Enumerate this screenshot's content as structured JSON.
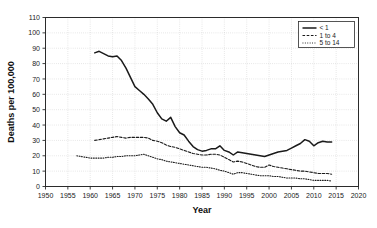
{
  "chart_data": {
    "type": "line",
    "title": "",
    "xlabel": "Year",
    "ylabel": "Deaths per 100,000",
    "xlim": [
      1950,
      2020
    ],
    "ylim": [
      0,
      110
    ],
    "xticks": [
      1950,
      1955,
      1960,
      1965,
      1970,
      1975,
      1980,
      1985,
      1990,
      1995,
      2000,
      2005,
      2010,
      2015,
      2020
    ],
    "yticks": [
      0,
      10,
      20,
      30,
      40,
      50,
      60,
      70,
      80,
      90,
      100,
      110
    ],
    "grid": true,
    "legend_position": "top-right",
    "series": [
      {
        "name": "< 1",
        "style": "solid",
        "color": "#1a1a1a",
        "x": [
          1961,
          1962,
          1963,
          1964,
          1965,
          1966,
          1967,
          1968,
          1969,
          1970,
          1971,
          1972,
          1973,
          1974,
          1975,
          1976,
          1977,
          1978,
          1979,
          1980,
          1981,
          1982,
          1983,
          1984,
          1985,
          1986,
          1987,
          1988,
          1989,
          1990,
          1991,
          1992,
          1993,
          1994,
          1995,
          1996,
          1997,
          1998,
          1999,
          2000,
          2001,
          2002,
          2003,
          2004,
          2005,
          2006,
          2007,
          2008,
          2009,
          2010,
          2011,
          2012,
          2013,
          2014
        ],
        "values": [
          87.0,
          88.0,
          86.5,
          85.0,
          84.5,
          85.0,
          82.0,
          77.0,
          71.0,
          65.0,
          62.5,
          60.0,
          57.0,
          53.5,
          48.0,
          44.0,
          42.5,
          45.0,
          39.0,
          35.0,
          33.5,
          29.5,
          26.0,
          24.0,
          23.0,
          23.5,
          24.5,
          24.5,
          26.5,
          23.5,
          22.5,
          20.5,
          22.5,
          22.0,
          21.5,
          21.0,
          20.5,
          20.0,
          19.5,
          20.5,
          21.5,
          22.5,
          23.0,
          23.5,
          25.0,
          26.5,
          28.0,
          30.5,
          29.5,
          26.5,
          28.5,
          29.5,
          29.0,
          29.0
        ]
      },
      {
        "name": "1 to 4",
        "style": "dashed",
        "color": "#1a1a1a",
        "x": [
          1961,
          1962,
          1963,
          1964,
          1965,
          1966,
          1967,
          1968,
          1969,
          1970,
          1971,
          1972,
          1973,
          1974,
          1975,
          1976,
          1977,
          1978,
          1979,
          1980,
          1981,
          1982,
          1983,
          1984,
          1985,
          1986,
          1987,
          1988,
          1989,
          1990,
          1991,
          1992,
          1993,
          1994,
          1995,
          1996,
          1997,
          1998,
          1999,
          2000,
          2001,
          2002,
          2003,
          2004,
          2005,
          2006,
          2007,
          2008,
          2009,
          2010,
          2011,
          2012,
          2013,
          2014
        ],
        "values": [
          30.0,
          30.5,
          31.0,
          31.5,
          32.0,
          32.5,
          32.0,
          31.5,
          32.0,
          32.0,
          32.0,
          32.0,
          31.5,
          30.0,
          29.5,
          28.5,
          27.0,
          26.0,
          25.5,
          24.5,
          23.5,
          22.5,
          21.5,
          21.0,
          20.5,
          20.5,
          21.0,
          21.0,
          20.5,
          19.0,
          17.5,
          16.0,
          16.5,
          16.0,
          15.0,
          14.0,
          13.0,
          12.5,
          12.5,
          14.0,
          13.0,
          12.5,
          12.0,
          11.5,
          11.0,
          10.5,
          10.0,
          10.0,
          9.5,
          9.0,
          8.5,
          8.5,
          8.5,
          8.0
        ]
      },
      {
        "name": "5 to 14",
        "style": "dotted",
        "color": "#1a1a1a",
        "x": [
          1957,
          1958,
          1959,
          1960,
          1961,
          1962,
          1963,
          1964,
          1965,
          1966,
          1967,
          1968,
          1969,
          1970,
          1971,
          1972,
          1973,
          1974,
          1975,
          1976,
          1977,
          1978,
          1979,
          1980,
          1981,
          1982,
          1983,
          1984,
          1985,
          1986,
          1987,
          1988,
          1989,
          1990,
          1991,
          1992,
          1993,
          1994,
          1995,
          1996,
          1997,
          1998,
          1999,
          2000,
          2001,
          2002,
          2003,
          2004,
          2005,
          2006,
          2007,
          2008,
          2009,
          2010,
          2011,
          2012,
          2013,
          2014
        ],
        "values": [
          20.0,
          19.5,
          19.0,
          18.5,
          18.5,
          18.5,
          18.5,
          19.0,
          19.0,
          19.5,
          19.5,
          20.0,
          20.0,
          20.0,
          20.5,
          21.0,
          20.0,
          19.0,
          18.0,
          17.5,
          16.5,
          16.0,
          15.5,
          15.0,
          14.5,
          14.0,
          13.5,
          13.0,
          12.5,
          12.5,
          12.0,
          11.5,
          10.5,
          10.0,
          9.0,
          8.0,
          9.0,
          9.0,
          8.5,
          8.0,
          7.5,
          7.0,
          7.0,
          7.0,
          6.5,
          6.5,
          6.0,
          5.5,
          5.5,
          5.5,
          5.0,
          5.0,
          4.5,
          4.0,
          4.0,
          4.0,
          4.0,
          3.5
        ]
      }
    ]
  }
}
